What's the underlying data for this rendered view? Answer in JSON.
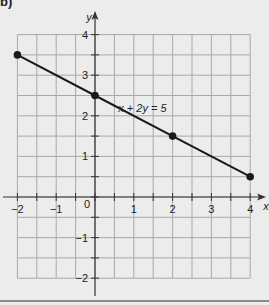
{
  "part_label": "b)",
  "chart_data": {
    "type": "line",
    "title": "",
    "xlabel": "x",
    "ylabel": "y",
    "xlim": [
      -2,
      4
    ],
    "ylim": [
      -2,
      4
    ],
    "grid": true,
    "grid_step": 0.5,
    "x_ticks": [
      -2,
      -1,
      0,
      1,
      2,
      3,
      4
    ],
    "x_tick_labels": [
      "−2",
      "−1",
      "0",
      "1",
      "2",
      "3",
      "4"
    ],
    "y_ticks": [
      -2,
      -1,
      1,
      2,
      3,
      4
    ],
    "y_tick_labels": [
      "−2",
      "−1",
      "1",
      "2",
      "3",
      "4"
    ],
    "series": [
      {
        "name": "x + 2y = 5",
        "x": [
          -2,
          0,
          2,
          4
        ],
        "y": [
          3.5,
          2.5,
          1.5,
          0.5
        ],
        "markers": true
      }
    ],
    "annotations": [
      {
        "text": "x + 2y = 5",
        "x": 0.6,
        "y": 2.2
      }
    ]
  },
  "colors": {
    "background": "#ececec",
    "grid": "#a8a8a8",
    "axis": "#333333",
    "line": "#1a1a1a",
    "text": "#222222"
  }
}
